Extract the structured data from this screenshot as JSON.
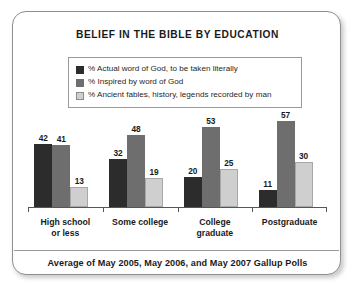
{
  "chart_data": {
    "type": "bar",
    "title": "BELIEF IN THE BIBLE BY EDUCATION",
    "xlabel": "",
    "ylabel": "",
    "ylim": [
      0,
      60
    ],
    "grid": false,
    "legend_position": "top-center",
    "categories": [
      "High school or less",
      "Some college",
      "College graduate",
      "Postgraduate"
    ],
    "category_lines": [
      [
        "High school",
        "or less"
      ],
      [
        "Some college"
      ],
      [
        "College",
        "graduate"
      ],
      [
        "Postgraduate"
      ]
    ],
    "series": [
      {
        "name": "% Actual word of God, to be taken literally",
        "color": "#2c2c2c",
        "values": [
          42,
          32,
          20,
          11
        ]
      },
      {
        "name": "% Inspired by word of God",
        "color": "#6e6e6e",
        "values": [
          41,
          48,
          53,
          57
        ]
      },
      {
        "name": "% Ancient fables, history, legends recorded by man",
        "color": "#cfcfcf",
        "values": [
          13,
          19,
          25,
          30
        ]
      }
    ],
    "annotation": "Average of May 2005, May 2006, and May 2007 Gallup Polls"
  },
  "footer": {
    "note": "Average of May 2005, May 2006, and May 2007 Gallup Polls"
  }
}
